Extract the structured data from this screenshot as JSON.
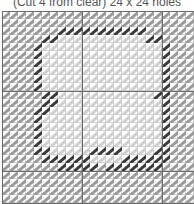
{
  "caption": "(Cut 4 from clear) 24 x 24 holes",
  "legend": {
    "g": {
      "name": "background-stitch",
      "color": "#9a9a9a"
    },
    "d": {
      "name": "outline-stitch",
      "color": "#3a3a3a"
    },
    "l": {
      "name": "interior-stitch",
      "color": "#cfcfcf"
    }
  },
  "grid": {
    "cols": 24,
    "rows": 24,
    "heavy_lines_every": 10,
    "cells": [
      "gggggggggggggggggggggggg",
      "gggggggggggggggggggggggg",
      "gggggggdddddddddddgggggg",
      "gggggddlllllllllllddgggg",
      "ggggdllllllllllllllldggg",
      "ggggdllllllllllllllldggg",
      "ggggdllllllllllllllldggg",
      "ggggdllllllllllllllldggg",
      "ggggdllllllllllllllldggg",
      "ggggdllllllllllllllldggg",
      "gggggddllllllllllllddggg",
      "gggggddllllllllllllldggg",
      "ggggddlllllllllllllldggg",
      "ggggdllllllllllllllldggg",
      "ggggdllllllllllllllldggg",
      "ggggdllllllllllllllldggg",
      "ggggdllllllllllllllldggg",
      "ggggddlllllddddllllddggg",
      "gggggddddddllllddddddggg",
      "gggggggdddddgdddddddgggg",
      "gggggggggggggggggggggggg",
      "gggggggggggggggggggggggg",
      "gggggggggggggggggggggggg",
      "gggggggggggggggggggggggg"
    ]
  }
}
